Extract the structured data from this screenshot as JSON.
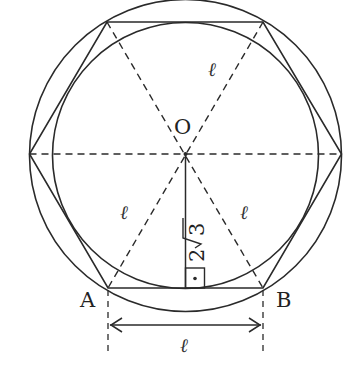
{
  "diagram": {
    "type": "regular hexagon with inscribed and circumscribed circles",
    "points": {
      "center": "O",
      "vertex_left_bottom": "A",
      "vertex_right_bottom": "B"
    },
    "labels": {
      "side_length": "ℓ",
      "top_radius_label": "ℓ",
      "left_radius_label": "ℓ",
      "right_radius_label": "ℓ",
      "bottom_dimension_label": "ℓ",
      "apothem_coeff": "2",
      "apothem_radicand": "3",
      "apothem_text": "2√3"
    },
    "colors": {
      "stroke": "#2a2a2a",
      "background": "#ffffff"
    },
    "annotations": {
      "right_angle_marker": "right angle at foot of apothem on AB",
      "dimension_arrow": "double-headed arrow between A and B measuring ℓ"
    }
  }
}
